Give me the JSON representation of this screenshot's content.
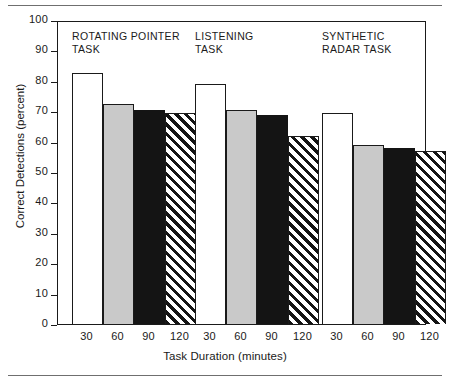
{
  "chart_data": {
    "type": "bar",
    "title": "",
    "xlabel": "Task Duration (minutes)",
    "ylabel": "Correct Detections (percent)",
    "ylim": [
      0,
      100
    ],
    "ytick_values": [
      0,
      10,
      20,
      30,
      40,
      50,
      60,
      70,
      80,
      90,
      100
    ],
    "ytick_labels": [
      "0",
      "10",
      "20",
      "30",
      "40",
      "50",
      "60",
      "70",
      "80",
      "90",
      "100"
    ],
    "categories": [
      "30",
      "60",
      "90",
      "120"
    ],
    "grid": false,
    "legend": "none",
    "groups": [
      {
        "name": "ROTATING POINTER\nTASK",
        "values": [
          82.5,
          72.3,
          70.5,
          69.5
        ]
      },
      {
        "name": "LISTENING\nTASK",
        "values": [
          79.0,
          70.5,
          68.8,
          62.0
        ]
      },
      {
        "name": "SYNTHETIC\nRADAR TASK",
        "values": [
          69.5,
          59.0,
          57.8,
          57.0
        ]
      }
    ],
    "series_styles": [
      "white",
      "gray",
      "black",
      "hatch"
    ],
    "colors": {
      "white": "#ffffff",
      "gray": "#c9c9c9",
      "black": "#141414",
      "hatch": "#141414",
      "axis": "#1a1a1a",
      "rule": "#6f6f6f"
    }
  }
}
